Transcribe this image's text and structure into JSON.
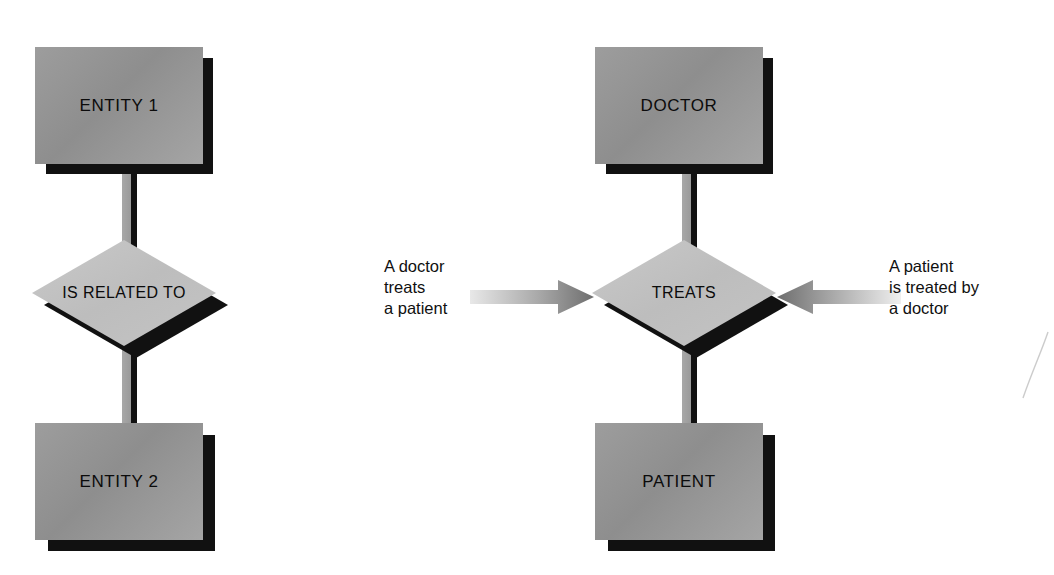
{
  "diagram": {
    "background_color": "#ffffff",
    "entity_fill_color": "#989898",
    "diamond_fill_color": "#c3c3c3",
    "shadow_color": "#111111",
    "text_color": "#0b0b0b"
  },
  "generic_model": {
    "name": "generic-er-model",
    "top_entity": "ENTITY 1",
    "relationship": "IS\nRELATED\nTO",
    "bottom_entity": "ENTITY 2"
  },
  "example_model": {
    "name": "doctor-patient-er-model",
    "top_entity": "DOCTOR",
    "relationship": "TREATS",
    "bottom_entity": "PATIENT",
    "left_caption": "A doctor\ntreats\na patient",
    "right_caption": "A patient\nis treated by\na doctor"
  },
  "arrows": {
    "left": {
      "name": "arrow-pointing-right",
      "direction": "right",
      "gradient_from": "#e4e4e4",
      "gradient_to": "#777777"
    },
    "right": {
      "name": "arrow-pointing-left",
      "direction": "left",
      "gradient_from": "#eeeeee",
      "gradient_to": "#6f6f6f"
    }
  }
}
